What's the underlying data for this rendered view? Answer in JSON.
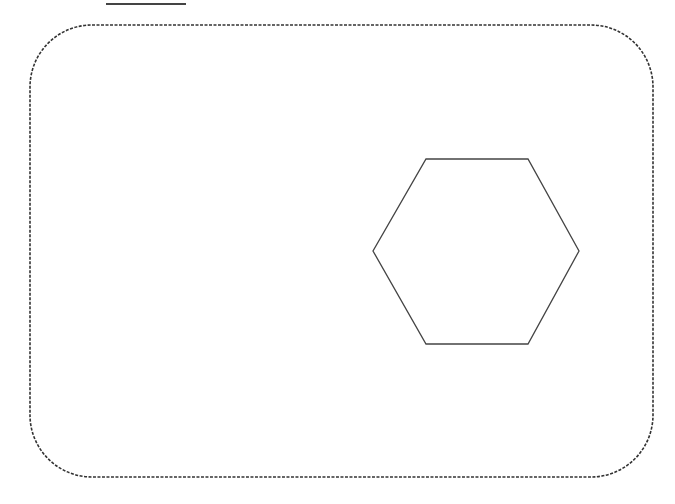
{
  "diagram": {
    "background": "#ffffff",
    "stroke_color": "#333333",
    "top_line": {
      "x1": 106,
      "y1": 4,
      "x2": 186,
      "y2": 4
    },
    "frame": {
      "shape": "rounded-rectangle",
      "style": "dashed",
      "x": 30,
      "y": 25,
      "width": 623,
      "height": 452,
      "radius": 62
    },
    "hexagon": {
      "shape": "hexagon",
      "points": "426,159 528,159 579,251 528,344 426,344 373,251"
    }
  }
}
